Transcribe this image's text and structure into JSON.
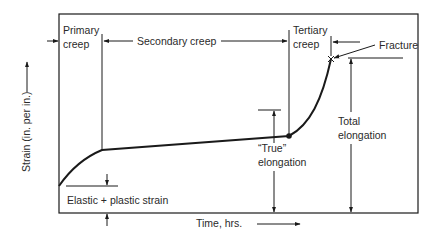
{
  "diagram": {
    "type": "creep-strain-vs-time",
    "axes": {
      "y_label": "Strain (in. per in.)",
      "x_label": "Time, hrs."
    },
    "stages": [
      {
        "id": "primary",
        "label_line1": "Primary",
        "label_line2": "creep"
      },
      {
        "id": "secondary",
        "label": "Secondary creep"
      },
      {
        "id": "tertiary",
        "label_line1": "Tertiary",
        "label_line2": "creep"
      }
    ],
    "annotations": {
      "fracture": "Fracture",
      "elastic_plastic": "Elastic + plastic strain",
      "true_elongation_line1": "“True”",
      "true_elongation_line2": "elongation",
      "total_elongation_line1": "Total",
      "total_elongation_line2": "elongation"
    },
    "colors": {
      "line": "#1a1a1a",
      "text": "#2a2a2a",
      "background": "#ffffff"
    }
  }
}
